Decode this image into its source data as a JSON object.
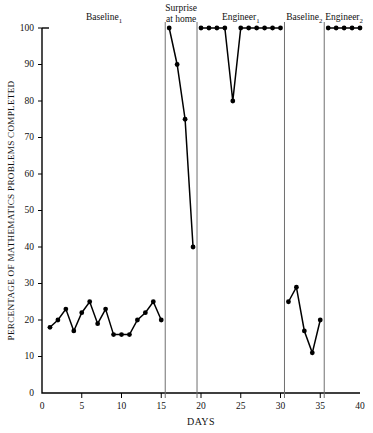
{
  "chart_data": {
    "type": "line",
    "title": "",
    "xlabel": "DAYS",
    "ylabel": "PERCENTAGE OF MATHEMATICS PROBLEMS COMPLETED",
    "xlim": [
      0,
      40
    ],
    "ylim": [
      0,
      100
    ],
    "xticks": [
      0,
      5,
      10,
      15,
      20,
      25,
      30,
      35,
      40
    ],
    "yticks": [
      0,
      10,
      20,
      30,
      40,
      50,
      60,
      70,
      80,
      90,
      100
    ],
    "grid": false,
    "legend": "none",
    "marker": "filled-circle",
    "phase_dividers": [
      15.5,
      19.5,
      30.5,
      35.5
    ],
    "phases": [
      {
        "name": "Baseline",
        "subscript": "1",
        "label": "Baseline₁",
        "center_day": 7.8,
        "two_line": false
      },
      {
        "name": "Surprise at home",
        "subscript": "",
        "label": "Surprise at home",
        "line1": "Surprise",
        "line2": "at home",
        "center_day": 17.5,
        "two_line": true
      },
      {
        "name": "Engineer",
        "subscript": "1",
        "label": "Engineer₁",
        "center_day": 25.0,
        "two_line": false
      },
      {
        "name": "Baseline",
        "subscript": "2",
        "label": "Baseline₂",
        "center_day": 33.0,
        "two_line": false
      },
      {
        "name": "Engineer",
        "subscript": "2",
        "label": "Engineer₂",
        "center_day": 38.0,
        "two_line": false
      }
    ],
    "series": [
      {
        "name": "Baseline₁",
        "x": [
          1,
          2,
          3,
          4,
          5,
          6,
          7,
          8,
          9,
          10,
          11,
          12,
          13,
          14,
          15
        ],
        "values": [
          18,
          20,
          23,
          17,
          22,
          25,
          19,
          23,
          16,
          16,
          16,
          20,
          22,
          25,
          20
        ]
      },
      {
        "name": "Surprise at home",
        "x": [
          16,
          17,
          18,
          19
        ],
        "values": [
          100,
          90,
          75,
          40
        ]
      },
      {
        "name": "Engineer₁",
        "x": [
          20,
          21,
          22,
          23,
          24,
          25,
          26,
          27,
          28,
          29,
          30
        ],
        "values": [
          100,
          100,
          100,
          100,
          80,
          100,
          100,
          100,
          100,
          100,
          100
        ]
      },
      {
        "name": "Baseline₂",
        "x": [
          31,
          32,
          33,
          34,
          35
        ],
        "values": [
          25,
          29,
          17,
          11,
          20
        ]
      },
      {
        "name": "Engineer₂",
        "x": [
          36,
          37,
          38,
          39,
          40
        ],
        "values": [
          100,
          100,
          100,
          100,
          100
        ]
      }
    ]
  }
}
